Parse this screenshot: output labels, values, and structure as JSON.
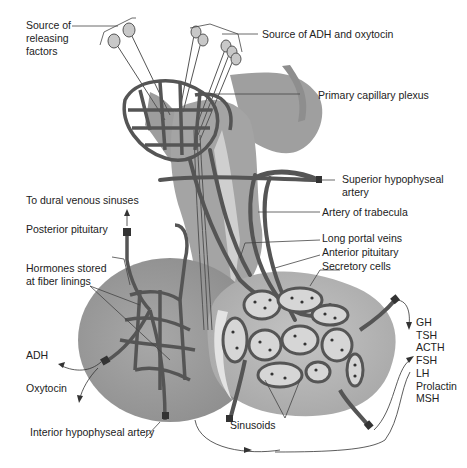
{
  "diagram": {
    "colors": {
      "vessel": "#555555",
      "vessel_outline": "#333333",
      "posterior_lobe": "#a6a6a6",
      "anterior_lobe": "#b9b9b9",
      "stalk": "#9a9a9a",
      "cell_fill": "#d6d6d6",
      "neuron_body": "#c8c8c8",
      "line": "#444444"
    },
    "labels": {
      "source_releasing": "Source of releasing factors",
      "source_adh": "Source of ADH and oxytocin",
      "primary_plexus": "Primary capillary plexus",
      "superior_artery": "Superior hypophyseal artery",
      "artery_trabecula": "Artery of trabecula",
      "long_portal": "Long portal veins",
      "anterior_pituitary": "Anterior pituitary",
      "secretory_cells": "Secretory cells",
      "to_dural": "To dural venous sinuses",
      "posterior_pituitary": "Posterior pituitary",
      "hormones_stored": "Hormones stored at fiber linings",
      "adh": "ADH",
      "oxytocin": "Oxytocin",
      "inferior_artery": "Interior hypophyseal artery",
      "sinusoids": "Sinusoids"
    },
    "anterior_hormones": [
      "GH",
      "TSH",
      "ACTH",
      "FSH",
      "LH",
      "Prolactin",
      "MSH"
    ]
  }
}
